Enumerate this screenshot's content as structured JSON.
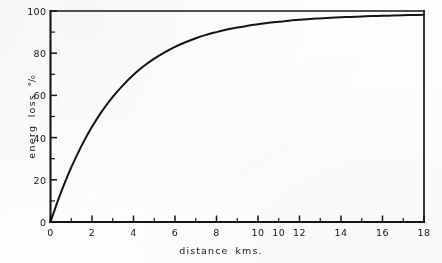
{
  "figure": {
    "background_color": "#fefefe",
    "ink_color": "#141414"
  },
  "axis_titles": {
    "x": "distance   kms.",
    "y_text": "energ  loss ",
    "y_percent_symbol": "°/₀"
  },
  "x_tick_labels": [
    "0",
    "2",
    "4",
    "6",
    "8",
    "10",
    "10",
    "12",
    "14",
    "16",
    "18"
  ],
  "x_tick_label_positions": [
    0,
    2,
    4,
    6,
    8,
    10,
    11,
    12,
    14,
    16,
    18
  ],
  "y_tick_labels": [
    "0",
    "20",
    "40",
    "60",
    "80",
    "100"
  ],
  "y_tick_label_positions": [
    0,
    20,
    40,
    60,
    80,
    100
  ],
  "chart_data": {
    "type": "line",
    "title": "",
    "subtitle": "",
    "xlabel": "distance   kms.",
    "ylabel": "energ  loss °/₀",
    "xlim": [
      0,
      18
    ],
    "ylim": [
      0,
      100
    ],
    "grid": false,
    "legend": null,
    "legend_position": "none",
    "x_major_tick_interval": 2,
    "x_minor_tick_interval": 1,
    "y_major_tick_interval": 20,
    "y_minor_tick_interval": 10,
    "x_tick_labels": [
      "0",
      "2",
      "4",
      "6",
      "8",
      "10",
      "10",
      "12",
      "14",
      "16",
      "18"
    ],
    "y_tick_labels": [
      "0",
      "20",
      "40",
      "60",
      "80",
      "100"
    ],
    "annotations": [],
    "series": [
      {
        "name": "energy loss",
        "x": [
          0,
          0.25,
          0.5,
          0.75,
          1,
          1.5,
          2,
          2.5,
          3,
          3.5,
          4,
          4.5,
          5,
          5.5,
          6,
          6.5,
          7,
          7.5,
          8,
          8.5,
          9,
          9.5,
          10,
          10.5,
          11,
          11.5,
          12,
          12.5,
          13,
          13.5,
          14,
          14.5,
          15,
          15.5,
          16,
          16.5,
          17,
          17.5,
          18
        ],
        "values": [
          0,
          7.2,
          13.9,
          20.1,
          25.9,
          36.2,
          45.1,
          52.8,
          59.3,
          64.9,
          69.8,
          73.9,
          77.4,
          80.4,
          83.0,
          85.2,
          87.1,
          88.7,
          90.0,
          91.2,
          92.2,
          93.0,
          93.7,
          94.4,
          94.9,
          95.4,
          95.8,
          96.2,
          96.5,
          96.8,
          97.0,
          97.2,
          97.4,
          97.6,
          97.7,
          97.9,
          98.0,
          98.1,
          98.2
        ]
      }
    ]
  }
}
